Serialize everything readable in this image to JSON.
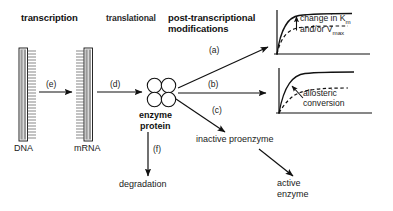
{
  "diagram": {
    "title_row": {
      "transcription": "transcription",
      "translational": "translational",
      "post_transcriptional_line1": "post-transcriptional",
      "post_transcriptional_line2": "modifications"
    },
    "nodes": {
      "dna": "DNA",
      "mrna": "mRNA",
      "enzyme_line1": "enzyme",
      "enzyme_line2": "protein",
      "inactive_proenzyme": "inactive proenzyme",
      "degradation": "degradation",
      "active_enzyme_line1": "active",
      "active_enzyme_line2": "enzyme"
    },
    "steps": {
      "a": "(a)",
      "b": "(b)",
      "c": "(c)",
      "d": "(d)",
      "e": "(e)",
      "f": "(f)"
    },
    "graphs": [
      {
        "id": "graph-km-vmax",
        "annotation_line1": "change in K",
        "annotation_sub1": "m",
        "annotation_line2": "and/or V",
        "annotation_sub2": "max",
        "solid_curve": "upper saturation curve",
        "dashed_curve": "lower saturation curve",
        "arrow": "up-arrow"
      },
      {
        "id": "graph-allosteric",
        "annotation_line1": "allosteric",
        "annotation_line2": "conversion",
        "solid_curve": "hyperbolic curve",
        "dashed_curve": "sigmoidal dashed curve",
        "arrow": "up-left-arrow"
      }
    ],
    "colors": {
      "ink": "#111111",
      "strand_fill": "#9a9a9a",
      "background": "#ffffff"
    }
  }
}
